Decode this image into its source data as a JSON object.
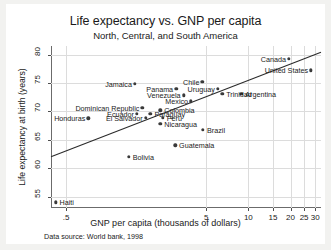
{
  "chart_data": {
    "type": "scatter",
    "title": "Life expectancy vs. GNP per capita",
    "subtitle": "North, Central, and South America",
    "xlabel": "GNP per capita (thousands of dollars)",
    "ylabel": "Life expectancy at birth (years)",
    "note": "Data source:  World bank, 1998",
    "xscale": "log",
    "xlim": [
      0.39,
      33
    ],
    "ylim": [
      53,
      81.5
    ],
    "xticks": [
      ".5",
      "5",
      "10",
      "15",
      "20",
      "25",
      "30"
    ],
    "xtick_values": [
      0.5,
      5,
      10,
      15,
      20,
      25,
      30
    ],
    "yticks": [
      "55",
      "60",
      "65",
      "70",
      "75",
      "80"
    ],
    "ytick_values": [
      55,
      60,
      65,
      70,
      75,
      80
    ],
    "grid": true,
    "legend": "none",
    "fit_line": {
      "label": "linear fit",
      "x_start": 0.39,
      "y_start": 62.0,
      "x_end": 33.0,
      "y_end": 80.4
    },
    "points": [
      {
        "name": "Canada",
        "x": 19.5,
        "y": 79.3,
        "label_pos": "left"
      },
      {
        "name": "United States",
        "x": 28.0,
        "y": 77.2,
        "label_pos": "left"
      },
      {
        "name": "Chile",
        "x": 4.7,
        "y": 75.2,
        "label_pos": "left"
      },
      {
        "name": "Jamaica",
        "x": 1.55,
        "y": 74.8,
        "label_pos": "left"
      },
      {
        "name": "Panama",
        "x": 3.05,
        "y": 74.0,
        "label_pos": "left"
      },
      {
        "name": "Uruguay",
        "x": 6.05,
        "y": 74.0,
        "label_pos": "left"
      },
      {
        "name": "Argentina",
        "x": 8.9,
        "y": 73.1,
        "label_pos": "right"
      },
      {
        "name": "Trinidad",
        "x": 6.5,
        "y": 73.1,
        "label_pos": "right"
      },
      {
        "name": "Venezuela",
        "x": 3.45,
        "y": 72.8,
        "label_pos": "left"
      },
      {
        "name": "Mexico",
        "x": 3.9,
        "y": 71.8,
        "label_pos": "left"
      },
      {
        "name": "Dominican Republic",
        "x": 1.75,
        "y": 70.6,
        "label_pos": "left"
      },
      {
        "name": "Colombia",
        "x": 2.35,
        "y": 70.2,
        "label_pos": "right"
      },
      {
        "name": "Ecuador",
        "x": 1.6,
        "y": 69.6,
        "label_pos": "left"
      },
      {
        "name": "Paraguay",
        "x": 2.0,
        "y": 69.6,
        "label_pos": "right"
      },
      {
        "name": "Peru",
        "x": 2.45,
        "y": 68.9,
        "label_pos": "right"
      },
      {
        "name": "El Salvador",
        "x": 1.85,
        "y": 68.9,
        "label_pos": "left"
      },
      {
        "name": "Honduras",
        "x": 0.72,
        "y": 68.8,
        "label_pos": "left"
      },
      {
        "name": "Nicaragua",
        "x": 2.35,
        "y": 67.8,
        "label_pos": "right"
      },
      {
        "name": "Brazil",
        "x": 4.75,
        "y": 66.8,
        "label_pos": "right"
      },
      {
        "name": "Guatemala",
        "x": 3.0,
        "y": 64.0,
        "label_pos": "right"
      },
      {
        "name": "Bolivia",
        "x": 1.4,
        "y": 62.0,
        "label_pos": "right"
      },
      {
        "name": "Haiti",
        "x": 0.42,
        "y": 54.0,
        "label_pos": "right"
      }
    ]
  }
}
